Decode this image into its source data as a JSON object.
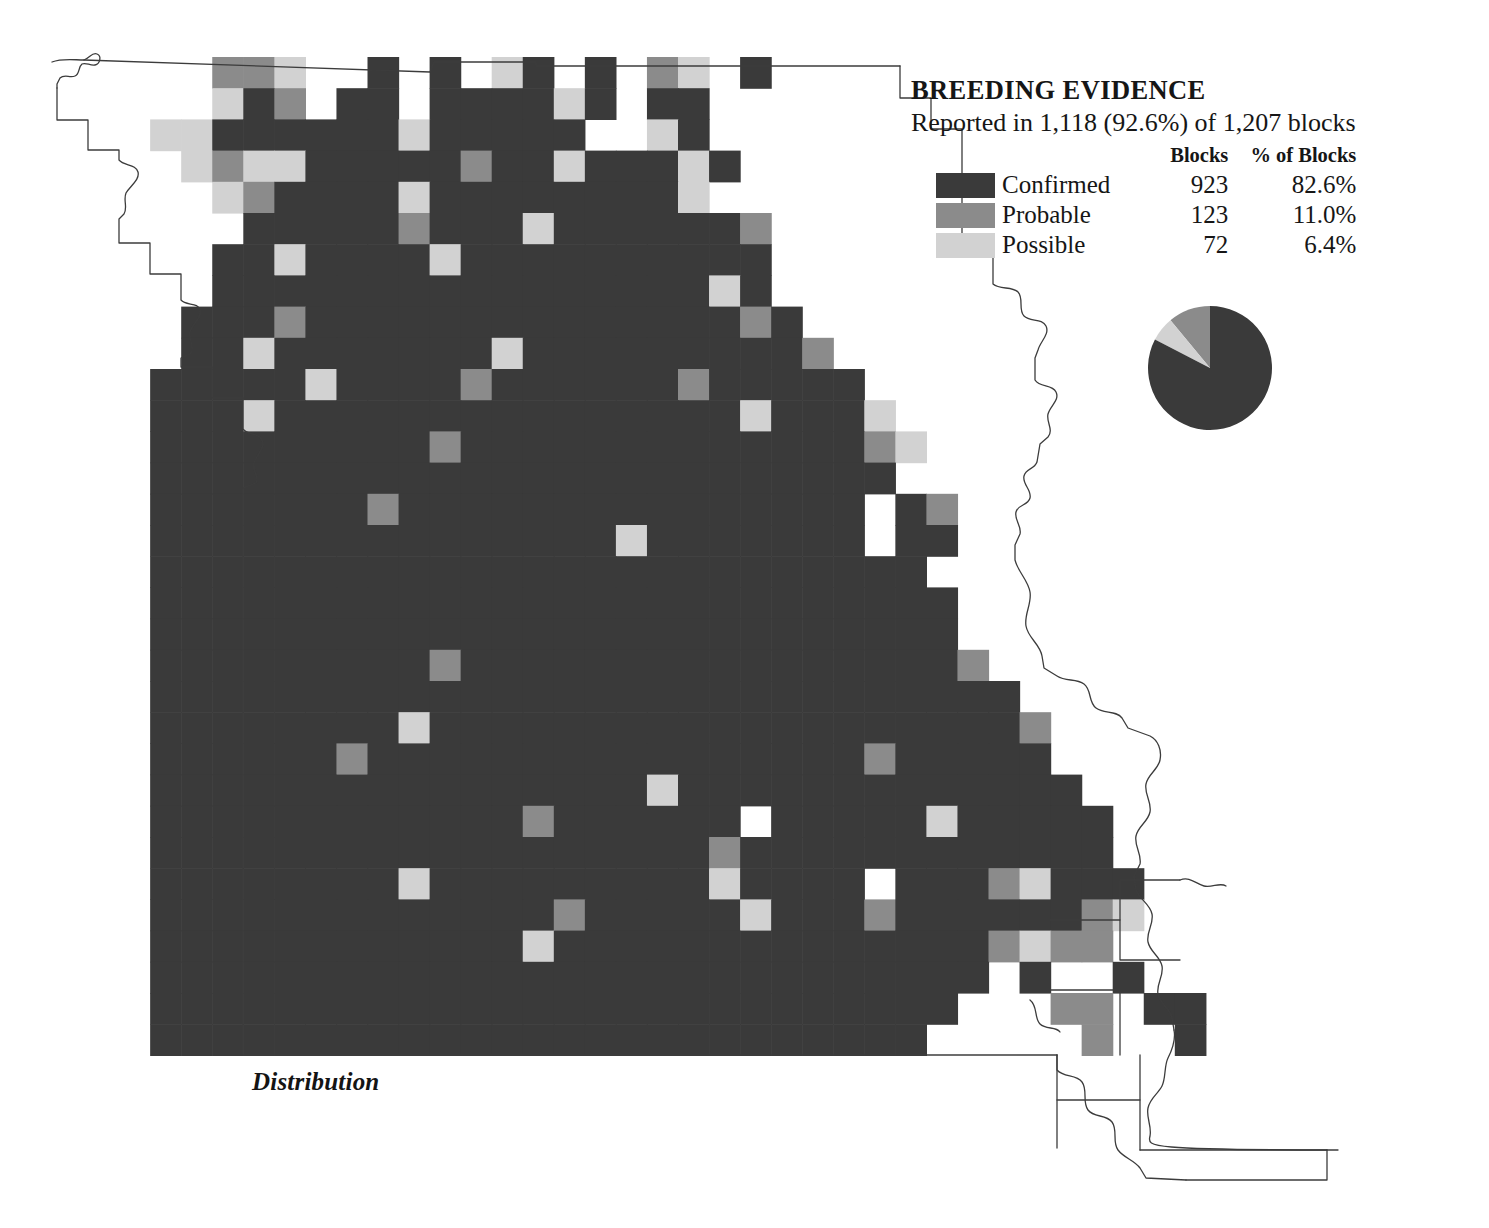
{
  "page": {
    "background": "#ffffff",
    "caption": "Distribution"
  },
  "legend": {
    "title": "BREEDING EVIDENCE",
    "subtitle": "Reported in 1,118 (92.6%) of 1,207 blocks",
    "columns": {
      "swatch": "",
      "category": "",
      "blocks": "Blocks",
      "percent": "% of Blocks"
    },
    "rows": [
      {
        "label": "Confirmed",
        "blocks": "923",
        "percent": "82.6%",
        "color": "#3a3a3a"
      },
      {
        "label": "Probable",
        "blocks": "123",
        "percent": "11.0%",
        "color": "#8b8b8b"
      },
      {
        "label": "Possible",
        "blocks": "72",
        "percent": "6.4%",
        "color": "#d2d2d2"
      }
    ]
  },
  "chart_data": {
    "type": "pie",
    "title": "BREEDING EVIDENCE",
    "subtitle": "Reported in 1,118 (92.6%) of 1,207 blocks",
    "categories": [
      "Confirmed",
      "Probable",
      "Possible"
    ],
    "values": [
      923,
      123,
      72
    ],
    "percentages": [
      82.6,
      11.0,
      6.4
    ],
    "colors": [
      "#3a3a3a",
      "#8b8b8b",
      "#d2d2d2"
    ],
    "total_blocks": 1207,
    "reported_blocks": 1118,
    "reported_percent": 92.6,
    "legend_position": "above-chart",
    "start_angle_deg": 90,
    "direction": "counterclockwise"
  },
  "map": {
    "region": "Missouri",
    "grid": {
      "origin_x": 57,
      "origin_y": 57,
      "cell_w": 31.05,
      "cell_h": 31.2,
      "cols": 40,
      "rows": 32
    },
    "colors": {
      "confirmed": "#3a3a3a",
      "probable": "#8b8b8b",
      "possible": "#d2d2d2",
      "none": "#ffffff",
      "outline": "#3c3c3c"
    },
    "code_legend": {
      "3": "confirmed",
      "2": "probable",
      "1": "possible",
      "0": "none"
    },
    "rows": [
      "0000022100303013030210300000000000000000",
      "0000013203303333130330000000000000000000",
      "0001133333313333300130000000000000000000",
      "0000121133333233133313000000000000000000",
      "0000012333313333333310000000000000000000",
      "0000003333323331333333200000000000000000",
      "0000033133331333333333300000000000000000",
      "0000033333333333333331300000000000000000",
      "0000333233333333333333230000000000000000",
      "0000331333333313333333332000000000000000",
      "0003333313333233333323333300000000000000",
      "0003331333333333333333133310000000000000",
      "0003333333332333333333333321000000000000",
      "0003333333333333333333333330000000000000",
      "0003333333233333333333333303200000000000",
      "0003333333333333331333333303300000000000",
      "0003333333333333333333333333000000000000",
      "0003333333333333333333333333300000000000",
      "0003333333333333333333333333300000000000",
      "0003333333332333333333333333320000000000",
      "0003333333333333333333333333333000000000",
      "0003333333313333333333333333333200000000",
      "0003333332333333333333333323333300000000",
      "0003333333333333333133333333333330000000",
      "0003333333333332333333033333133333000000",
      "0003333333333333333332333333333333000000",
      "0003333333313333333331333303332133300000",
      "0003333333333333233333133323333332100000",
      "0003333333333331333333333333332122000000",
      "0003333333333333333333333333330300300000",
      "0003333333333333333333333333300022033000",
      "0003333333333333333333333333000002003000"
    ]
  }
}
